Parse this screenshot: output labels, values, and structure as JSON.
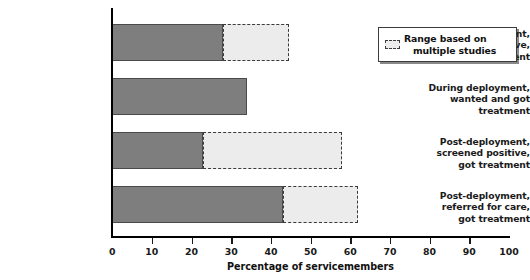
{
  "chart_data": {
    "type": "bar",
    "orientation": "horizontal",
    "title": "",
    "xlabel": "Percentage of servicemembers",
    "ylabel": "",
    "xlim": [
      0,
      100
    ],
    "xticks": [
      0,
      10,
      20,
      30,
      40,
      50,
      60,
      70,
      80,
      90,
      100
    ],
    "xtick_labels": [
      "0",
      "10",
      "20",
      "30",
      "40",
      "50",
      "60",
      "70",
      "80",
      "90",
      "100"
    ],
    "grid": false,
    "categories": [
      "During deployment, screened positive, got treatment",
      "During deployment, wanted and got treatment",
      "Post-deployment, screened positive, got treatment",
      "Post-deployment, referred for care, got treatment"
    ],
    "category_lines": [
      [
        "During deployment,",
        "screened positive,",
        "got treatment"
      ],
      [
        "During deployment,",
        "wanted and got",
        "treatment"
      ],
      [
        "Post-deployment,",
        "screened positive,",
        "got treatment"
      ],
      [
        "Post-deployment,",
        "referred for care,",
        "got treatment"
      ]
    ],
    "series": [
      {
        "name": "Percentage of servicemembers",
        "values": [
          28,
          34,
          23,
          43
        ]
      },
      {
        "name": "Range based on multiple studies",
        "range_max": [
          44.5,
          null,
          58,
          62
        ]
      }
    ],
    "colors": {
      "bar_fill": "#7e7e7e",
      "bar_edge": "#4a4a4a",
      "range_fill": "#ececec",
      "range_edge": "#3a3a3a",
      "axis": "#000000",
      "text": "#111111"
    },
    "legend": {
      "position": "top-right",
      "entries": [
        {
          "label_lines": [
            "Range based on",
            "multiple studies"
          ],
          "label": "Range based on multiple studies",
          "swatch": "dashed-light-gray"
        }
      ]
    }
  }
}
